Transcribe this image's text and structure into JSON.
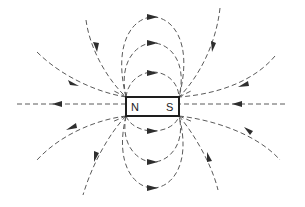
{
  "diagram": {
    "magnet": {
      "north_label": "N",
      "south_label": "S"
    },
    "colors": {
      "background": "#ffffff",
      "field_line": "#5a5a5a",
      "arrow": "#2e2e2e",
      "magnet_outline": "#1e1e1e"
    },
    "field_line_count": 12,
    "line_style": "dashed"
  }
}
